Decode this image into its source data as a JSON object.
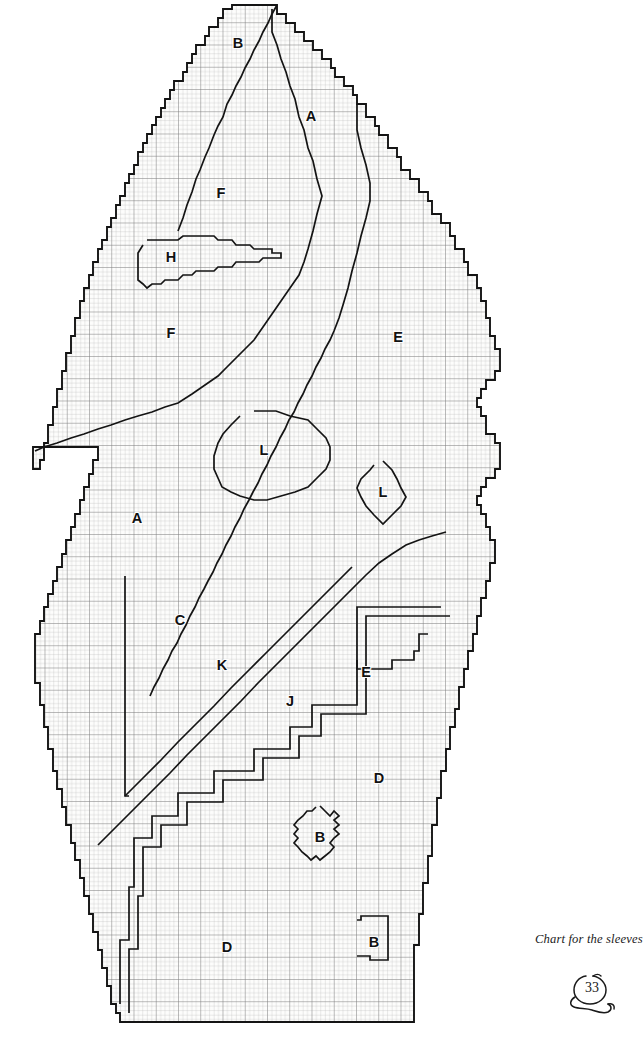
{
  "page": {
    "caption": "Chart for the sleeves",
    "page_number": "33",
    "doodle_icon": "hand-drawn-circle-swirl-icon"
  },
  "colors": {
    "background": "#ffffff",
    "paper": "#fdfdfc",
    "grid_minor": "#b4b4b4",
    "grid_major": "#7d7d7d",
    "outline": "#141414",
    "label_text": "#111111",
    "caption_text": "#1a1a1a"
  },
  "chart_data": {
    "type": "table",
    "title": "Chart for the sleeves",
    "subtitle": "",
    "xlabel": "",
    "ylabel": "",
    "grid": true,
    "legend_position": "none",
    "grid_cell_px": 4.45,
    "grid_major_every": 5,
    "grid_columns": 105,
    "grid_rows": 230,
    "region_letters": [
      "A",
      "B",
      "C",
      "D",
      "E",
      "F",
      "H",
      "J",
      "K",
      "L"
    ],
    "labels": [
      {
        "id": "label-b-top",
        "text": "B",
        "x": 238,
        "y": 44
      },
      {
        "id": "label-a-top",
        "text": "A",
        "x": 311,
        "y": 117
      },
      {
        "id": "label-f-upper",
        "text": "F",
        "x": 221,
        "y": 194
      },
      {
        "id": "label-h",
        "text": "H",
        "x": 171,
        "y": 258
      },
      {
        "id": "label-f-lower",
        "text": "F",
        "x": 171,
        "y": 334
      },
      {
        "id": "label-e-right",
        "text": "E",
        "x": 398,
        "y": 338
      },
      {
        "id": "label-l-large",
        "text": "L",
        "x": 264,
        "y": 451
      },
      {
        "id": "label-l-small",
        "text": "L",
        "x": 383,
        "y": 493
      },
      {
        "id": "label-a-mid",
        "text": "A",
        "x": 137,
        "y": 519
      },
      {
        "id": "label-c",
        "text": "C",
        "x": 180,
        "y": 621
      },
      {
        "id": "label-k",
        "text": "K",
        "x": 222,
        "y": 666
      },
      {
        "id": "label-e-notch",
        "text": "E",
        "x": 366,
        "y": 673
      },
      {
        "id": "label-j",
        "text": "J",
        "x": 290,
        "y": 702
      },
      {
        "id": "label-d-right",
        "text": "D",
        "x": 379,
        "y": 779
      },
      {
        "id": "label-b-diamond",
        "text": "B",
        "x": 320,
        "y": 838
      },
      {
        "id": "label-d-bottom",
        "text": "D",
        "x": 227,
        "y": 948
      },
      {
        "id": "label-b-bottom",
        "text": "B",
        "x": 374,
        "y": 943
      }
    ],
    "outline_points": "232,5 277,5 277,14 286,14 286,23 295,23 295,32 304,32 304,41 313,41 313,50 322,50 322,59 331,59 331,68 335,68 335,77 344,77 344,86 353,86 353,95 357,95 357,104 366,104 366,117 375,117 375,126 379,126 379,135 388,135 388,148 397,148 397,157 401,157 401,170 410,170 410,179 419,179 419,192 428,192 428,201 432,201 432,214 441,214 441,223 450,223 450,236 455,236 455,249 464,249 464,262 468,262 468,275 477,275 477,288 481,288 481,301 486,301 486,318 490,318 490,336 495,336 495,349 500,349 500,371 495,371 495,380 486,380 486,389 481,389 481,398 477,398 477,407 481,407 481,416 486,416 486,434 495,434 495,443 500,443 500,469 495,469 495,478 486,478 486,487 481,487 481,496 477,496 477,505 481,505 481,514 486,514 486,527 490,527 490,540 495,540 495,563 490,563 490,581 486,581 486,598 481,598 481,616 477,616 477,634 473,634 473,651 468,651 468,669 464,669 464,687 459,687 459,709 455,709 455,727 450,727 450,749 446,749 446,771 441,771 441,798 437,798 437,825 432,825 432,856 428,856 428,883 423,883 423,914 419,914 419,945 414,945 414,1022 120,1022 120,1013 116,1013 116,1004 111,1004 111,986 107,986 107,968 102,968 102,950 98,950 98,932 93,932 93,914 89,914 89,896 84,896 84,878 80,878 80,860 75,860 75,843 71,843 71,825 66,825 66,807 62,807 62,789 57,789 57,771 53,771 53,749 48,749 48,727 44,727 44,705 40,705 40,683 35,683 35,634 40,634 40,621 44,621 44,607 48,607 48,594 53,594 53,581 57,581 57,567 62,567 62,554 66,554 66,540 71,540 71,527 75,527 75,514 80,514 80,500 84,500 84,487 89,487 89,474 93,474 93,460 98,460 98,447 33,447 33,469 40,469 40,460 44,460 44,443 48,443 48,425 53,425 53,407 57,407 57,389 62,389 62,371 66,371 66,353 71,353 71,336 75,336 75,318 80,318 80,301 84,301 84,288 89,288 89,275 93,275 93,262 98,262 98,249 102,249 102,240 107,240 107,227 111,227 111,218 116,218 116,205 120,205 120,196 125,196 125,183 129,183 129,174 134,174 134,165 138,165 138,152 143,152 143,143 147,143 147,134 152,134 152,125 156,125 156,117 161,117 161,108 165,108 165,99 170,99 170,90 174,90 174,81 183,81 183,72 187,72 187,63 192,63 192,54 196,54 196,45 205,45 205,36 209,36 209,27 218,27 218,18 223,18 223,9 232,9",
    "boundaries": [
      {
        "id": "boundary-b-a",
        "note": "diagonal separating top B wedge from A",
        "points": "277,5 272,14 268,23 263,32 259,41 254,50 250,59 245,68 241,77 236,86 232,95 227,104 223,117 218,126 214,135 209,148 205,157 200,170 196,179 192,192 187,205 183,218 178,231"
      },
      {
        "id": "boundary-a-f",
        "note": "long curve from the top tip down past H to the L oval, separating A/E from F",
        "points": "272,9 272,32 277,45 281,59 286,72 290,86 295,99 299,117 304,130 308,148 313,161 317,179 322,196 317,214 313,231 308,249 304,262 299,275 290,288 281,301 272,314 263,327 254,340 245,349 236,358 227,367 218,376 205,385 192,394 178,403 165,407 152,412 138,416 125,420 111,425 98,429 84,434 71,438 57,443 44,447 35,451"
      },
      {
        "id": "boundary-a-e",
        "note": "boundary between A and the right-hand E region",
        "points": "357,104 357,130 361,148 366,165 370,183 370,201 366,218 361,236 357,253 352,271 348,288 343,305 339,318 334,331 330,340 325,349 321,358 316,367 312,376 307,385 303,394 298,403 294,412 289,420 285,429 280,438 276,447 271,456 267,465 262,474 258,483 253,492 249,500 244,509 240,518 235,527 231,536 226,545 222,554 217,563 213,572 208,581 204,589 199,598 195,607 190,616 186,625 181,634 177,643 172,651 168,660 163,669 159,678 154,687 150,696"
      },
      {
        "id": "boundary-h",
        "note": "leaf-shaped H region outline",
        "points": "147,240 178,240 183,236 214,236 218,240 232,240 236,245 250,245 254,249 272,249 272,253 281,253 281,258 263,258 259,262 236,262 232,267 218,267 214,271 196,271 192,275 183,275 178,280 165,280 161,284 152,284 147,288 143,284 138,280 138,267 138,253 143,245"
      },
      {
        "id": "boundary-l-large",
        "note": "large oval L region",
        "points": "254,411 276,411 290,416 308,420 317,429 326,438 330,447 330,460 326,469 317,478 308,487 295,492 281,496 267,500 254,500 240,496 231,492 222,487 218,478 214,469 214,456 218,443 223,434 231,425 240,416"
      },
      {
        "id": "boundary-l-small",
        "note": "small diamond L region",
        "points": "383,461 392,470 397,479 401,488 406,497 401,506 392,515 383,524 374,515 366,506 361,497 357,488 361,479 370,470 374,465"
      },
      {
        "id": "boundary-c-box",
        "note": "top and left edge of the C region box",
        "points": "125,576 125,796 129,796"
      },
      {
        "id": "boundary-c-k",
        "note": "stair diagonal between C and K",
        "points": "125,796 143,778 161,760 178,742 196,724 214,706 231,688 249,670 267,652 285,634 303,616 321,598 339,580 352,567"
      },
      {
        "id": "boundary-k-j",
        "note": "stair diagonal between K and J",
        "points": "98,845 116,827 134,809 152,791 170,773 187,755 205,737 223,719 241,701 258,683 276,665 294,647 312,629 330,611 348,593 366,575 379,563 392,554 406,545 419,540 432,536 446,532"
      },
      {
        "id": "boundary-e-notch",
        "note": "small E region notch near right side",
        "points": "357,660 357,669 392,669 392,660 414,660 414,651 419,651 419,634 428,634"
      },
      {
        "id": "boundary-j-d",
        "note": "stepped boundary between J and D",
        "points": "441,607 357,607 357,705 312,705 312,727 290,727 290,749 254,749 254,771 214,771 214,793 178,793 178,816 152,816 152,838 134,838 134,887 129,887 129,940 120,940 120,1004"
      },
      {
        "id": "boundary-j-d-inner",
        "note": "parallel inner stepped boundary",
        "points": "450,616 366,616 366,714 321,714 321,736 299,736 299,758 263,758 263,780 223,780 223,802 187,802 187,825 161,825 161,847 143,847 143,896 138,896 138,949 129,949 129,1013"
      },
      {
        "id": "boundary-b-diamond",
        "note": "small diamond-shaped B region near the bottom",
        "points": "320,806 325,811 330,816 334,811 339,816 334,820 339,825 334,829 339,834 334,838 330,843 334,847 330,852 325,856 320,860 316,856 311,860 307,856 302,852 298,847 294,843 298,838 294,834 298,829 294,825 298,820 303,816 307,811 312,811 316,807"
      },
      {
        "id": "boundary-b-bottom",
        "note": "rectangular B region at the bottom right",
        "points": "357,920 361,920 361,916 388,916 388,960 370,960 370,956 357,956"
      }
    ]
  }
}
